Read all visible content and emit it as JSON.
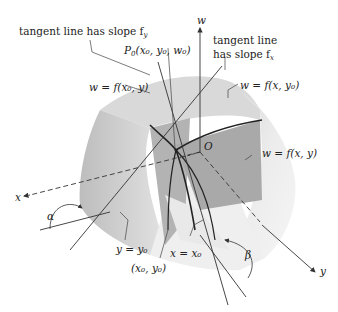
{
  "labels": {
    "tangent_fy": "tangent line has slope f",
    "tangent_fy_sub": "y",
    "tangent_fx_1": "tangent line",
    "tangent_fx_2": "has slope f",
    "tangent_fx_sub": "x",
    "point": "P",
    "point_sub": "0",
    "point_coords": "(x₀, y₀, w₀)",
    "curve_x0": "w = f(x₀, y)",
    "curve_y0": "w = f(x, y₀)",
    "surface": "w = f(x, y)",
    "origin": "O",
    "axis_w": "w",
    "axis_x": "x",
    "axis_y": "y",
    "plane_y0": "y = y₀",
    "plane_x0": "x = x₀",
    "base_point": "(x₀, y₀)",
    "angle_alpha": "α",
    "angle_beta": "β"
  },
  "colors": {
    "surface_light": "#e6e6e6",
    "surface_mid": "#cfcfcf",
    "plane_dark": "#a8a8a8",
    "line": "#333333",
    "text": "#222222"
  }
}
